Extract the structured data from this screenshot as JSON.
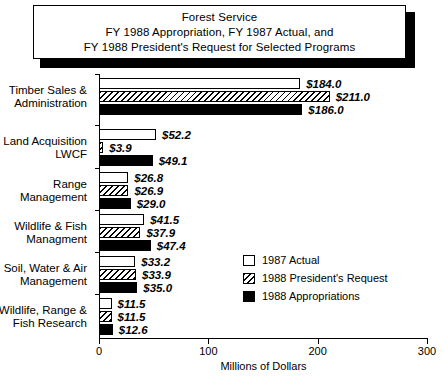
{
  "title": {
    "lines": [
      "Forest Service",
      "FY 1988 Appropriation, FY 1987 Actual, and",
      "FY 1988 President's Request for Selected Programs"
    ]
  },
  "legend": {
    "items": [
      {
        "label": "1987 Actual",
        "swatch": "white-square-icon"
      },
      {
        "label": "1988 President's Request",
        "swatch": "hatched-square-icon"
      },
      {
        "label": "1988 Appropriations",
        "swatch": "black-square-icon"
      }
    ]
  },
  "axis": {
    "x_title": "Millions of Dollars",
    "x_ticks": [
      "0",
      "100",
      "200",
      "300"
    ]
  },
  "chart_data": {
    "type": "bar",
    "orientation": "horizontal",
    "title": "Forest Service FY 1988 Appropriation, FY 1987 Actual, and FY 1988 President's Request for Selected Programs",
    "xlabel": "Millions of Dollars",
    "ylabel": "",
    "xlim": [
      0,
      300
    ],
    "xticks": [
      0,
      100,
      200,
      300
    ],
    "grid": false,
    "legend_position": "inside-lower-right",
    "categories": [
      "Timber Sales & Administration",
      "Land Acquisition LWCF",
      "Range Management",
      "Wildlife & Fish Managment",
      "Soil, Water & Air Management",
      "Wildlife, Range & Fish Research"
    ],
    "category_lines": [
      [
        "Timber Sales &",
        "Administration"
      ],
      [
        "Land Acquisition",
        "LWCF"
      ],
      [
        "Range",
        "Management"
      ],
      [
        "Wildlife & Fish",
        "Managment"
      ],
      [
        "Soil, Water & Air",
        "Management"
      ],
      [
        "Wildlife, Range &",
        "Fish Research"
      ]
    ],
    "series": [
      {
        "name": "1987 Actual",
        "values": [
          184.0,
          52.2,
          26.8,
          41.5,
          33.2,
          11.5
        ],
        "labels": [
          "$184.0",
          "$52.2",
          "$26.8",
          "$41.5",
          "$33.2",
          "$11.5"
        ]
      },
      {
        "name": "1988 President's Request",
        "values": [
          211.0,
          3.9,
          26.9,
          37.9,
          33.9,
          11.5
        ],
        "labels": [
          "$211.0",
          "$3.9",
          "$26.9",
          "$37.9",
          "$33.9",
          "$11.5"
        ]
      },
      {
        "name": "1988 Appropriations",
        "values": [
          186.0,
          49.1,
          29.0,
          47.4,
          35.0,
          12.6
        ],
        "labels": [
          "$186.0",
          "$49.1",
          "$29.0",
          "$47.4",
          "$35.0",
          "$12.6"
        ]
      }
    ]
  }
}
